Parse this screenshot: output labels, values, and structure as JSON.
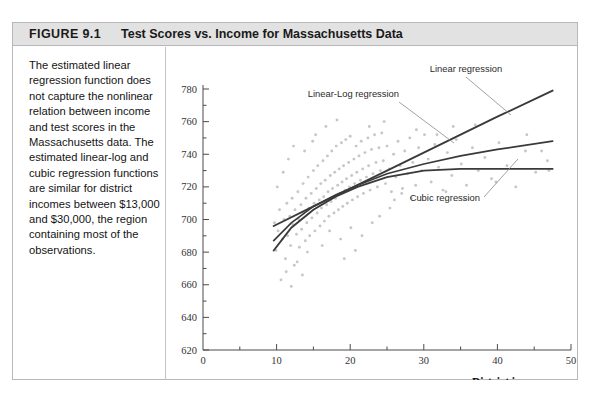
{
  "figure": {
    "number": "FIGURE 9.1",
    "title": "Test Scores vs. Income for Massachusetts Data",
    "caption": "The estimated linear regression function does not capture the nonlinear relation between income and test scores in the Massachusetts data. The estimated linear-log and cubic regression functions are similar for district incomes between $13,000 and $30,000, the region containing most of the observations."
  },
  "colors": {
    "header_band": "#e2e2e2",
    "panel_border": "#b8b8b8",
    "scatter_point": "#c6c6cc",
    "curve": "#3a3a3a",
    "axis": "#4a4a4a"
  },
  "annotations": [
    {
      "label": "Linear regression",
      "x": 470,
      "y": 70
    },
    {
      "label": "Linear-Log regression",
      "x": 406,
      "y": 93
    },
    {
      "label": "Cubic regression",
      "x": 440,
      "y": 182
    }
  ],
  "chart_data": {
    "type": "scatter",
    "title": "Test Scores vs. Income for Massachusetts Data",
    "xlabel": "District income (Thousands of dollars)",
    "ylabel": "Test score",
    "xlim": [
      0,
      50
    ],
    "ylim": [
      620,
      780
    ],
    "xticks": [
      0,
      10,
      20,
      30,
      40,
      50
    ],
    "xtick_labels": [
      "0",
      "10",
      "20",
      "30",
      "40",
      "50"
    ],
    "x_minor_step": 5,
    "yticks": [
      620,
      640,
      660,
      680,
      700,
      720,
      740,
      760,
      780
    ],
    "ytick_labels": [
      "620",
      "640",
      "660",
      "680",
      "700",
      "720",
      "740",
      "760",
      "780"
    ],
    "y_minor_step": 10,
    "grid": false,
    "legend": "annotations-on-curves",
    "points": [
      [
        9.7,
        698
      ],
      [
        9.9,
        681
      ],
      [
        10.2,
        693
      ],
      [
        10.4,
        706
      ],
      [
        10.6,
        663
      ],
      [
        10.8,
        688
      ],
      [
        11.0,
        700
      ],
      [
        11.2,
        676
      ],
      [
        11.4,
        710
      ],
      [
        11.5,
        690
      ],
      [
        11.8,
        702
      ],
      [
        11.9,
        684
      ],
      [
        12.1,
        713
      ],
      [
        12.2,
        697
      ],
      [
        12.4,
        672
      ],
      [
        12.5,
        706
      ],
      [
        12.7,
        691
      ],
      [
        12.9,
        717
      ],
      [
        13.0,
        700
      ],
      [
        13.1,
        683
      ],
      [
        13.3,
        709
      ],
      [
        13.4,
        694
      ],
      [
        13.6,
        722
      ],
      [
        13.7,
        704
      ],
      [
        13.9,
        687
      ],
      [
        14.0,
        713
      ],
      [
        14.1,
        698
      ],
      [
        14.3,
        726
      ],
      [
        14.4,
        707
      ],
      [
        14.5,
        690
      ],
      [
        14.7,
        716
      ],
      [
        14.8,
        701
      ],
      [
        15.0,
        730
      ],
      [
        15.1,
        710
      ],
      [
        15.2,
        693
      ],
      [
        15.4,
        719
      ],
      [
        15.5,
        704
      ],
      [
        15.6,
        733
      ],
      [
        15.8,
        712
      ],
      [
        15.9,
        696
      ],
      [
        16.0,
        722
      ],
      [
        16.1,
        707
      ],
      [
        16.3,
        736
      ],
      [
        16.4,
        714
      ],
      [
        16.5,
        699
      ],
      [
        16.6,
        724
      ],
      [
        16.8,
        709
      ],
      [
        16.9,
        739
      ],
      [
        17.0,
        717
      ],
      [
        17.1,
        702
      ],
      [
        17.3,
        727
      ],
      [
        17.4,
        711
      ],
      [
        17.5,
        742
      ],
      [
        17.6,
        719
      ],
      [
        17.8,
        704
      ],
      [
        17.9,
        729
      ],
      [
        18.0,
        713
      ],
      [
        18.1,
        745
      ],
      [
        18.3,
        721
      ],
      [
        18.4,
        706
      ],
      [
        18.5,
        731
      ],
      [
        18.6,
        716
      ],
      [
        18.8,
        747
      ],
      [
        18.9,
        723
      ],
      [
        19.0,
        708
      ],
      [
        19.1,
        733
      ],
      [
        19.3,
        718
      ],
      [
        19.4,
        749
      ],
      [
        19.5,
        725
      ],
      [
        19.6,
        710
      ],
      [
        19.8,
        735
      ],
      [
        19.9,
        720
      ],
      [
        20.0,
        751
      ],
      [
        20.2,
        727
      ],
      [
        20.3,
        712
      ],
      [
        20.5,
        737
      ],
      [
        20.6,
        722
      ],
      [
        20.8,
        745
      ],
      [
        20.9,
        729
      ],
      [
        21.0,
        714
      ],
      [
        21.2,
        739
      ],
      [
        21.4,
        724
      ],
      [
        21.5,
        748
      ],
      [
        21.7,
        731
      ],
      [
        21.8,
        716
      ],
      [
        22.0,
        741
      ],
      [
        22.2,
        726
      ],
      [
        22.4,
        750
      ],
      [
        22.5,
        733
      ],
      [
        22.7,
        718
      ],
      [
        22.9,
        743
      ],
      [
        23.1,
        728
      ],
      [
        23.3,
        752
      ],
      [
        23.5,
        735
      ],
      [
        23.7,
        720
      ],
      [
        23.9,
        744
      ],
      [
        24.1,
        730
      ],
      [
        24.3,
        753
      ],
      [
        24.5,
        736
      ],
      [
        24.8,
        722
      ],
      [
        25.0,
        745
      ],
      [
        25.3,
        731
      ],
      [
        25.6,
        717
      ],
      [
        25.9,
        740
      ],
      [
        26.2,
        726
      ],
      [
        26.5,
        748
      ],
      [
        26.8,
        733
      ],
      [
        27.1,
        719
      ],
      [
        27.4,
        742
      ],
      [
        27.8,
        728
      ],
      [
        28.1,
        750
      ],
      [
        28.5,
        735
      ],
      [
        28.9,
        721
      ],
      [
        29.3,
        744
      ],
      [
        29.7,
        730
      ],
      [
        30.1,
        752
      ],
      [
        30.6,
        737
      ],
      [
        31.0,
        723
      ],
      [
        31.5,
        746
      ],
      [
        32.0,
        732
      ],
      [
        32.6,
        718
      ],
      [
        33.2,
        741
      ],
      [
        33.8,
        727
      ],
      [
        34.4,
        749
      ],
      [
        35.1,
        734
      ],
      [
        35.8,
        721
      ],
      [
        36.6,
        744
      ],
      [
        37.4,
        730
      ],
      [
        38.3,
        738
      ],
      [
        39.2,
        725
      ],
      [
        40.2,
        747
      ],
      [
        41.3,
        733
      ],
      [
        42.5,
        720
      ],
      [
        43.8,
        742
      ],
      [
        45.2,
        729
      ],
      [
        46.8,
        736
      ],
      [
        11.3,
        668
      ],
      [
        12.0,
        659
      ],
      [
        12.8,
        674
      ],
      [
        13.5,
        666
      ],
      [
        14.2,
        680
      ],
      [
        10.1,
        720
      ],
      [
        10.9,
        729
      ],
      [
        11.6,
        737
      ],
      [
        12.3,
        745
      ],
      [
        15.3,
        752
      ],
      [
        16.7,
        757
      ],
      [
        18.2,
        761
      ],
      [
        13.8,
        742
      ],
      [
        14.9,
        748
      ],
      [
        17.2,
        693
      ],
      [
        18.7,
        688
      ],
      [
        20.1,
        695
      ],
      [
        21.6,
        690
      ],
      [
        23.0,
        698
      ],
      [
        24.0,
        702
      ],
      [
        25.4,
        707
      ],
      [
        26.0,
        712
      ],
      [
        27.0,
        716
      ],
      [
        28.3,
        713
      ],
      [
        29.0,
        755
      ],
      [
        31.8,
        752
      ],
      [
        34.0,
        757
      ],
      [
        37.0,
        758
      ],
      [
        44.0,
        752
      ],
      [
        46.0,
        742
      ],
      [
        47.0,
        730
      ],
      [
        33.0,
        717
      ],
      [
        35.5,
        712
      ],
      [
        39.8,
        723
      ],
      [
        22.6,
        757
      ],
      [
        24.6,
        760
      ],
      [
        19.2,
        676
      ],
      [
        20.7,
        681
      ],
      [
        16.2,
        684
      ]
    ],
    "curves": [
      {
        "name": "Linear regression",
        "form": "linear",
        "x_range": [
          9.6,
          47.5
        ],
        "points": [
          [
            9.6,
            696
          ],
          [
            15,
            708
          ],
          [
            20,
            719
          ],
          [
            25,
            730
          ],
          [
            30,
            741
          ],
          [
            35,
            752
          ],
          [
            40,
            763
          ],
          [
            47.5,
            779
          ]
        ],
        "note": "straight line, steepest at right"
      },
      {
        "name": "Linear-Log regression",
        "form": "linear-log",
        "x_range": [
          9.6,
          47.5
        ],
        "points": [
          [
            9.6,
            687
          ],
          [
            12,
            698
          ],
          [
            15,
            708
          ],
          [
            18,
            715
          ],
          [
            21,
            721
          ],
          [
            25,
            728
          ],
          [
            30,
            734
          ],
          [
            35,
            739
          ],
          [
            40,
            743
          ],
          [
            47.5,
            748
          ]
        ],
        "note": "concave increasing"
      },
      {
        "name": "Cubic regression",
        "form": "cubic",
        "x_range": [
          9.6,
          47.5
        ],
        "points": [
          [
            9.6,
            681
          ],
          [
            12,
            695
          ],
          [
            15,
            706
          ],
          [
            18,
            714
          ],
          [
            21,
            720
          ],
          [
            25,
            726
          ],
          [
            30,
            730
          ],
          [
            35,
            731
          ],
          [
            40,
            731
          ],
          [
            47.5,
            731
          ]
        ],
        "note": "flattens out at high income"
      }
    ]
  }
}
